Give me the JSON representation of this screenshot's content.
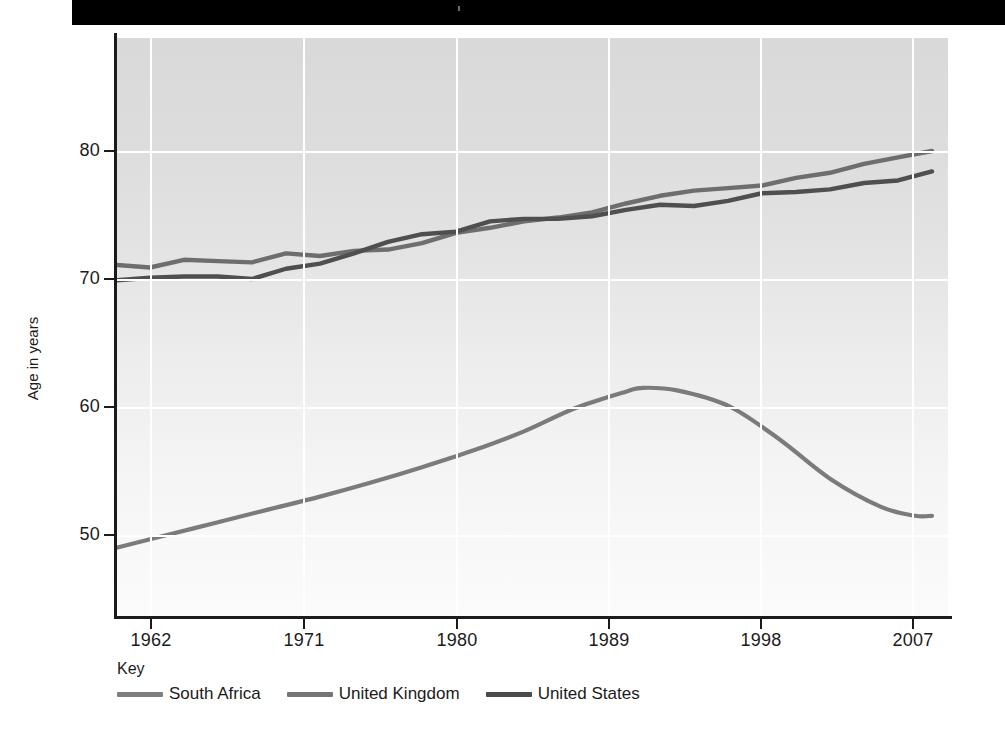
{
  "banner": {
    "name": "top-black-banner"
  },
  "chart_data": {
    "type": "line",
    "title": "",
    "xlabel": "",
    "ylabel": "Age in years",
    "xlim": [
      1960,
      2008
    ],
    "ylim": [
      45.5,
      90
    ],
    "grid": true,
    "legend_position": "below-left",
    "legend_title": "Key",
    "x_ticks": [
      "1962",
      "1971",
      "1980",
      "1989",
      "1998",
      "2007"
    ],
    "x_tick_values": [
      1962,
      1971,
      1980,
      1989,
      1998,
      2007
    ],
    "y_ticks": [
      "50",
      "60",
      "70",
      "80"
    ],
    "y_tick_values": [
      50,
      60,
      70,
      80
    ],
    "series": [
      {
        "name": "South Africa",
        "color": "#7b7b7b",
        "x": [
          1960,
          1963,
          1966,
          1969,
          1972,
          1975,
          1978,
          1981,
          1984,
          1987,
          1990,
          1991,
          1993,
          1996,
          1999,
          2002,
          2005,
          2007,
          2008
        ],
        "values": [
          49.0,
          50.0,
          51.0,
          52.0,
          53.0,
          54.1,
          55.3,
          56.6,
          58.1,
          59.9,
          61.2,
          61.5,
          61.3,
          60.1,
          57.5,
          54.4,
          52.2,
          51.5,
          51.5
        ]
      },
      {
        "name": "United Kingdom",
        "color": "#6e6e6e",
        "x": [
          1960,
          1962,
          1964,
          1966,
          1968,
          1970,
          1972,
          1974,
          1976,
          1978,
          1980,
          1982,
          1984,
          1986,
          1988,
          1990,
          1992,
          1994,
          1996,
          1998,
          2000,
          2002,
          2004,
          2006,
          2008
        ],
        "values": [
          71.1,
          70.9,
          71.5,
          71.4,
          71.3,
          72.0,
          71.8,
          72.2,
          72.3,
          72.8,
          73.6,
          74.0,
          74.5,
          74.8,
          75.2,
          75.9,
          76.5,
          76.9,
          77.1,
          77.3,
          77.9,
          78.3,
          79.0,
          79.5,
          80.0
        ],
        "note": "upper line at right edge"
      },
      {
        "name": "United States",
        "color": "#4f4f4f",
        "x": [
          1960,
          1962,
          1964,
          1966,
          1968,
          1970,
          1972,
          1974,
          1976,
          1978,
          1980,
          1982,
          1984,
          1986,
          1988,
          1990,
          1992,
          1994,
          1996,
          1998,
          2000,
          2002,
          2004,
          2006,
          2008
        ],
        "values": [
          69.9,
          70.1,
          70.2,
          70.2,
          70.0,
          70.8,
          71.2,
          72.0,
          72.9,
          73.5,
          73.7,
          74.5,
          74.7,
          74.7,
          74.9,
          75.4,
          75.8,
          75.7,
          76.1,
          76.7,
          76.8,
          77.0,
          77.5,
          77.7,
          78.4
        ],
        "note": "lower line at right edge"
      }
    ]
  },
  "axis": {
    "y_title": "Age in years"
  },
  "legend": {
    "title": "Key",
    "items": [
      {
        "label": "South Africa",
        "color": "#7e7e7e"
      },
      {
        "label": "United Kingdom",
        "color": "#757575"
      },
      {
        "label": "United States",
        "color": "#4a4a4a"
      }
    ]
  }
}
